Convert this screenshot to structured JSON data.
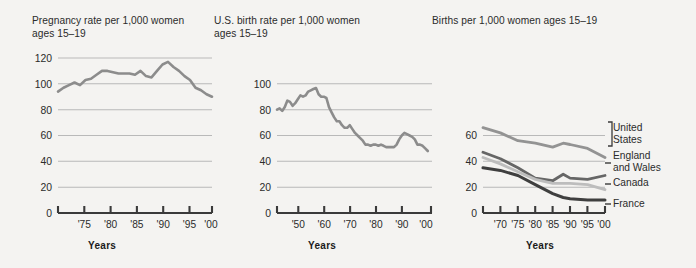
{
  "figure": {
    "background_color": "#f4f3f1",
    "line_color_primary": "#8c8c8c",
    "gridline_color": "#b9b9b9",
    "axis_color": "#3a3a3a"
  },
  "panels": [
    {
      "id": "panel-1",
      "title": "Pregnancy rate per 1,000 women\nages 15–19",
      "xlabel": "Years"
    },
    {
      "id": "panel-2",
      "title": "U.S. birth rate per 1,000 women\nages 15–19",
      "xlabel": "Years"
    },
    {
      "id": "panel-3",
      "title": "Births per 1,000 women ages 15–19",
      "xlabel": "Years"
    }
  ],
  "legend": {
    "united_states": "United\nStates",
    "england_and_wales": "England\nand Wales",
    "canada": "Canada",
    "france": "France"
  },
  "chart_data": [
    {
      "type": "line",
      "title": "Pregnancy rate per 1,000 women ages 15–19",
      "xlabel": "Years",
      "ylabel": "",
      "ylim": [
        0,
        120
      ],
      "yticks": [
        0,
        20,
        40,
        60,
        80,
        100,
        120
      ],
      "ytick_labels": [
        "0",
        "20",
        "40",
        "60",
        "80",
        "100",
        "120"
      ],
      "xlim": [
        1972,
        2001
      ],
      "xticks": [
        1975,
        1980,
        1985,
        1990,
        1995,
        2000
      ],
      "xtick_labels": [
        "'75",
        "'80",
        "'85",
        "'90",
        "'95",
        "'00"
      ],
      "grid": true,
      "legend": "none",
      "series": [
        {
          "name": "Pregnancy rate",
          "color": "#8c8c8c",
          "x": [
            1972,
            1973,
            1974,
            1975,
            1976,
            1977,
            1978,
            1979,
            1980,
            1981,
            1982,
            1983,
            1984,
            1985,
            1986,
            1987,
            1988,
            1989,
            1990,
            1991,
            1992,
            1993,
            1994,
            1995,
            1996,
            1997,
            1998,
            1999,
            2000
          ],
          "values": [
            94,
            97,
            99,
            101,
            99,
            103,
            104,
            107,
            110,
            110,
            109,
            108,
            108,
            108,
            107,
            110,
            106,
            105,
            110,
            115,
            117,
            113,
            110,
            106,
            103,
            97,
            95,
            92,
            90
          ]
        }
      ]
    },
    {
      "type": "line",
      "title": "U.S. birth rate per 1,000 women ages 15–19",
      "xlabel": "Years",
      "ylabel": "",
      "ylim": [
        0,
        100
      ],
      "yticks": [
        0,
        20,
        40,
        60,
        80,
        100
      ],
      "ytick_labels": [
        "0",
        "20",
        "40",
        "60",
        "80",
        "100"
      ],
      "xlim": [
        1942,
        2001
      ],
      "xticks": [
        1950,
        1960,
        1970,
        1980,
        1990,
        2000
      ],
      "xtick_labels": [
        "'50",
        "'60",
        "'70",
        "'80",
        "'90",
        "'00"
      ],
      "grid": true,
      "legend": "none",
      "series": [
        {
          "name": "U.S. birth rate",
          "color": "#8c8c8c",
          "x": [
            1942,
            1943,
            1944,
            1945,
            1946,
            1947,
            1948,
            1949,
            1950,
            1951,
            1952,
            1953,
            1954,
            1955,
            1956,
            1957,
            1958,
            1959,
            1960,
            1961,
            1962,
            1963,
            1964,
            1965,
            1966,
            1967,
            1968,
            1969,
            1970,
            1971,
            1972,
            1973,
            1974,
            1975,
            1976,
            1977,
            1978,
            1979,
            1980,
            1981,
            1982,
            1983,
            1984,
            1985,
            1986,
            1987,
            1988,
            1989,
            1990,
            1991,
            1992,
            1993,
            1994,
            1995,
            1996,
            1997,
            1998,
            1999,
            2000
          ],
          "values": [
            80,
            81,
            79,
            82,
            87,
            86,
            83,
            85,
            88,
            91,
            90,
            91,
            94,
            95,
            96,
            96,
            92,
            90,
            90,
            89,
            82,
            78,
            74,
            71,
            71,
            68,
            66,
            66,
            68,
            65,
            62,
            60,
            58,
            56,
            53,
            53,
            52,
            53,
            53,
            52,
            53,
            52,
            51,
            51,
            51,
            51,
            53,
            57,
            60,
            62,
            61,
            60,
            59,
            57,
            54,
            53,
            52,
            50,
            48
          ]
        }
      ]
    },
    {
      "type": "line",
      "title": "Births per 1,000 women ages 15–19",
      "xlabel": "Years",
      "ylabel": "",
      "ylim": [
        0,
        70
      ],
      "yticks": [
        0,
        20,
        40,
        60
      ],
      "ytick_labels": [
        "0",
        "20",
        "40",
        "60"
      ],
      "xlim": [
        1965,
        2001
      ],
      "xticks": [
        1970,
        1975,
        1980,
        1985,
        1990,
        1995,
        2000
      ],
      "xtick_labels": [
        "'70",
        "'75",
        "'80",
        "'85",
        "'90",
        "'95",
        "'00"
      ],
      "grid": true,
      "legend": "right",
      "series": [
        {
          "name": "United States",
          "color": "#939393",
          "x": [
            1965,
            1970,
            1975,
            1980,
            1985,
            1988,
            1990,
            1995,
            2000
          ],
          "values": [
            66,
            62,
            56,
            54,
            51,
            54,
            53,
            50,
            43
          ]
        },
        {
          "name": "England and Wales",
          "color": "#666666",
          "x": [
            1965,
            1970,
            1975,
            1980,
            1985,
            1988,
            1990,
            1995,
            2000
          ],
          "values": [
            47,
            42,
            35,
            27,
            25,
            30,
            27,
            26,
            29
          ]
        },
        {
          "name": "Canada",
          "color": "#bdbdbd",
          "x": [
            1965,
            1970,
            1975,
            1980,
            1985,
            1988,
            1990,
            1995,
            2000
          ],
          "values": [
            43,
            38,
            32,
            26,
            23,
            23,
            23,
            22,
            18
          ]
        },
        {
          "name": "France",
          "color": "#3f3f3f",
          "x": [
            1965,
            1970,
            1975,
            1980,
            1985,
            1988,
            1990,
            1995,
            2000
          ],
          "values": [
            35,
            33,
            29,
            22,
            15,
            12,
            11,
            10,
            10
          ]
        }
      ]
    }
  ]
}
